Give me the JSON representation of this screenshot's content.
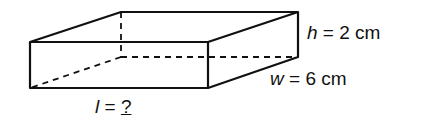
{
  "diagram": {
    "shape": "rectangular prism",
    "labels": {
      "height_var": "h",
      "height_eq": " = 2 cm",
      "width_var": "w",
      "width_eq": " = 6 cm",
      "length_var": "l",
      "length_eq": " = ",
      "length_value": "?"
    },
    "colors": {
      "stroke": "#111111",
      "background": "#ffffff"
    }
  }
}
